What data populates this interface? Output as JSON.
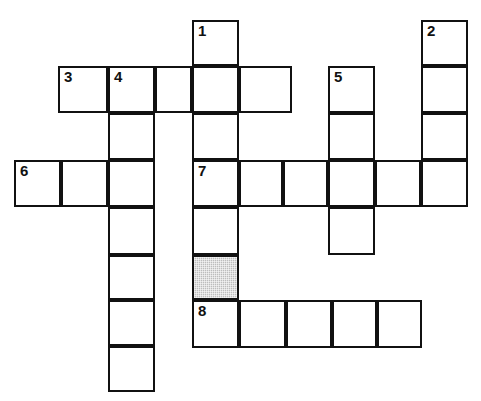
{
  "puzzle": {
    "kind": "crossword-grid",
    "background_color": "#ffffff",
    "line_color": "#111111",
    "shaded_color": "#bdbdbd",
    "cell_size": 47,
    "clue_numbers": [
      "1",
      "2",
      "3",
      "4",
      "5",
      "6",
      "7",
      "8"
    ],
    "cells": [
      {
        "id": "c-1",
        "x": 192,
        "y": 20,
        "w": 47,
        "h": 46,
        "number": "1",
        "shaded": false
      },
      {
        "id": "c-2",
        "x": 421,
        "y": 20,
        "w": 47,
        "h": 46,
        "number": "2",
        "shaded": false
      },
      {
        "id": "c-3",
        "x": 421,
        "y": 66,
        "w": 47,
        "h": 47,
        "number": "",
        "shaded": false
      },
      {
        "id": "c-4",
        "x": 421,
        "y": 113,
        "w": 47,
        "h": 47,
        "number": "",
        "shaded": false
      },
      {
        "id": "c-5",
        "x": 421,
        "y": 160,
        "w": 47,
        "h": 47,
        "number": "",
        "shaded": false
      },
      {
        "id": "c-6",
        "x": 58,
        "y": 66,
        "w": 50,
        "h": 47,
        "number": "3",
        "shaded": false
      },
      {
        "id": "c-7",
        "x": 108,
        "y": 66,
        "w": 47,
        "h": 47,
        "number": "4",
        "shaded": false
      },
      {
        "id": "c-8",
        "x": 155,
        "y": 66,
        "w": 37,
        "h": 47,
        "number": "",
        "shaded": false
      },
      {
        "id": "c-9",
        "x": 192,
        "y": 66,
        "w": 47,
        "h": 47,
        "number": "",
        "shaded": false
      },
      {
        "id": "c-10",
        "x": 239,
        "y": 66,
        "w": 53,
        "h": 47,
        "number": "",
        "shaded": false
      },
      {
        "id": "c-11",
        "x": 328,
        "y": 66,
        "w": 47,
        "h": 47,
        "number": "5",
        "shaded": false
      },
      {
        "id": "c-12",
        "x": 328,
        "y": 113,
        "w": 47,
        "h": 47,
        "number": "",
        "shaded": false
      },
      {
        "id": "c-13",
        "x": 328,
        "y": 160,
        "w": 47,
        "h": 47,
        "number": "",
        "shaded": false
      },
      {
        "id": "c-14",
        "x": 328,
        "y": 207,
        "w": 47,
        "h": 48,
        "number": "",
        "shaded": false
      },
      {
        "id": "c-15",
        "x": 108,
        "y": 113,
        "w": 47,
        "h": 47,
        "number": "",
        "shaded": false
      },
      {
        "id": "c-16",
        "x": 192,
        "y": 113,
        "w": 47,
        "h": 47,
        "number": "",
        "shaded": false
      },
      {
        "id": "c-17",
        "x": 14,
        "y": 160,
        "w": 47,
        "h": 47,
        "number": "6",
        "shaded": false
      },
      {
        "id": "c-18",
        "x": 61,
        "y": 160,
        "w": 47,
        "h": 47,
        "number": "",
        "shaded": false
      },
      {
        "id": "c-19",
        "x": 108,
        "y": 160,
        "w": 47,
        "h": 47,
        "number": "",
        "shaded": false
      },
      {
        "id": "c-20",
        "x": 192,
        "y": 160,
        "w": 47,
        "h": 47,
        "number": "7",
        "shaded": false
      },
      {
        "id": "c-21",
        "x": 239,
        "y": 160,
        "w": 44,
        "h": 47,
        "number": "",
        "shaded": false
      },
      {
        "id": "c-22",
        "x": 283,
        "y": 160,
        "w": 45,
        "h": 47,
        "number": "",
        "shaded": false
      },
      {
        "id": "c-23",
        "x": 375,
        "y": 160,
        "w": 46,
        "h": 47,
        "number": "",
        "shaded": false
      },
      {
        "id": "c-24",
        "x": 108,
        "y": 207,
        "w": 47,
        "h": 48,
        "number": "",
        "shaded": false
      },
      {
        "id": "c-25",
        "x": 192,
        "y": 207,
        "w": 47,
        "h": 48,
        "number": "",
        "shaded": false
      },
      {
        "id": "c-26",
        "x": 108,
        "y": 255,
        "w": 47,
        "h": 45,
        "number": "",
        "shaded": false
      },
      {
        "id": "c-27",
        "x": 192,
        "y": 255,
        "w": 47,
        "h": 45,
        "number": "",
        "shaded": true
      },
      {
        "id": "c-28",
        "x": 108,
        "y": 300,
        "w": 47,
        "h": 46,
        "number": "",
        "shaded": false
      },
      {
        "id": "c-29",
        "x": 192,
        "y": 300,
        "w": 47,
        "h": 48,
        "number": "8",
        "shaded": false
      },
      {
        "id": "c-30",
        "x": 239,
        "y": 300,
        "w": 47,
        "h": 48,
        "number": "",
        "shaded": false
      },
      {
        "id": "c-31",
        "x": 286,
        "y": 300,
        "w": 46,
        "h": 48,
        "number": "",
        "shaded": false
      },
      {
        "id": "c-32",
        "x": 332,
        "y": 300,
        "w": 45,
        "h": 48,
        "number": "",
        "shaded": false
      },
      {
        "id": "c-33",
        "x": 377,
        "y": 300,
        "w": 45,
        "h": 48,
        "number": "",
        "shaded": false
      },
      {
        "id": "c-34",
        "x": 108,
        "y": 346,
        "w": 47,
        "h": 46,
        "number": "",
        "shaded": false
      }
    ]
  }
}
